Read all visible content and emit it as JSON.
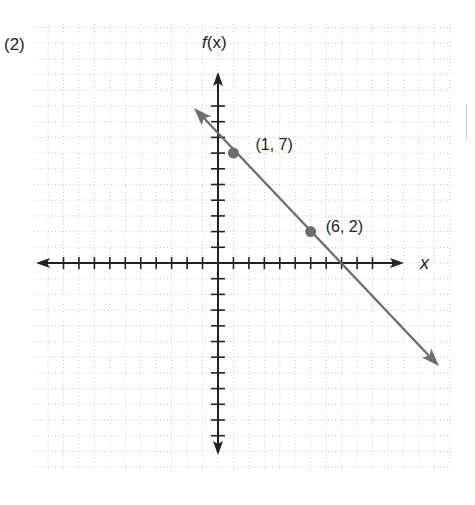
{
  "problem_number": "(2)",
  "chart_data": {
    "type": "line",
    "title": "",
    "xlabel": "x",
    "ylabel": "f(x)",
    "grid": true,
    "xlim": [
      -11,
      12
    ],
    "ylim": [
      -12,
      15
    ],
    "axis_ticks": {
      "x": [
        -10,
        -9,
        -8,
        -7,
        -6,
        -5,
        -4,
        -3,
        -2,
        -1,
        1,
        2,
        3,
        4,
        5,
        6,
        7,
        8,
        9,
        10
      ],
      "y": [
        -11,
        -10,
        -9,
        -8,
        -7,
        -6,
        -5,
        -4,
        -3,
        -2,
        -1,
        1,
        2,
        3,
        4,
        5,
        6,
        7,
        8,
        9,
        10
      ]
    },
    "series": [
      {
        "name": "f(x) = -x + 8",
        "type": "line",
        "arrows": "both",
        "color": "#6e6e6e",
        "x": [
          -1.5,
          14.1
        ],
        "y": [
          9.5,
          -6.5
        ]
      }
    ],
    "points": [
      {
        "x": 1,
        "y": 7,
        "label": "(1, 7)"
      },
      {
        "x": 6,
        "y": 2,
        "label": "(6, 2)"
      }
    ]
  },
  "labels": {
    "f_name": "f",
    "f_arg": "(x)",
    "x_axis": "x"
  },
  "colors": {
    "axis": "#222222",
    "line": "#6e6e6e",
    "point": "#6e6e6e",
    "grid": "#c8c8c8"
  }
}
